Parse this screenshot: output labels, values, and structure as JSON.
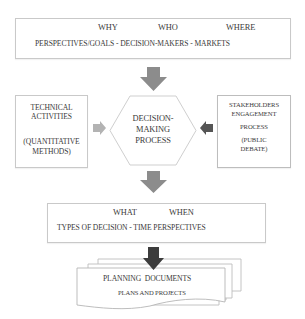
{
  "top_box": {
    "headers": [
      "WHY",
      "WHO",
      "WHERE"
    ],
    "line": "PERSPECTIVES/GOALS - DECISION-MAKERS - MARKETS"
  },
  "left_box": {
    "line1": "TECHNICAL",
    "line2": "ACTIVITIES",
    "line3": "(QUANTITATIVE",
    "line4": "METHODS)"
  },
  "center_hexagon": {
    "line1": "DECISION-",
    "line2": "MAKING",
    "line3": "PROCESS"
  },
  "right_box": {
    "line1": "STAKEHOLDERS",
    "line2": "ENGAGEMENT",
    "line3": "PROCESS",
    "line4": "(PUBLIC",
    "line5": "DEBATE)"
  },
  "bottom_box": {
    "headers": [
      "WHAT",
      "WHEN"
    ],
    "line": "TYPES OF DECISION - TIME PERSPECTIVES"
  },
  "documents": {
    "title": "PLANNING DOCUMENTS",
    "subtitle": "PLANS AND PROJECTS"
  },
  "colors": {
    "arrow_gray": "#8c8c8c",
    "arrow_light": "#b3b3b3",
    "arrow_dark": "#555555",
    "arrow_black": "#3c3c3c",
    "border": "#c9c9c9"
  }
}
